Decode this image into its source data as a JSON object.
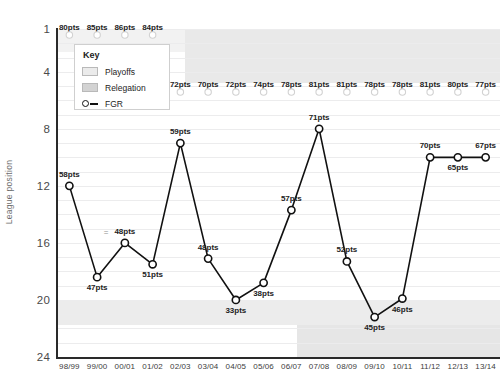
{
  "chart_data": {
    "type": "line",
    "title": "",
    "xlabel": "",
    "ylabel": "League position",
    "ylim": [
      1,
      24
    ],
    "y_inverted": true,
    "grid": true,
    "yticks": [
      1,
      4,
      8,
      12,
      16,
      20,
      24
    ],
    "categories": [
      "98/99",
      "99/00",
      "00/01",
      "01/02",
      "02/03",
      "03/04",
      "04/05",
      "05/06",
      "06/07",
      "07/08",
      "08/09",
      "09/10",
      "10/11",
      "11/12",
      "12/13",
      "13/14"
    ],
    "series": [
      {
        "name": "FGR",
        "values": [
          12,
          18.4,
          16,
          17.5,
          9,
          17.1,
          20,
          18.8,
          13.7,
          8,
          17.3,
          21.2,
          19.9,
          10,
          10,
          10
        ],
        "point_labels": [
          "58pts",
          "47pts",
          "48pts",
          "51pts",
          "59pts",
          "48pts",
          "33pts",
          "38pts",
          "57pts",
          "71pts",
          "52pts",
          "45pts",
          "46pts",
          "70pts",
          "65pts",
          "67pts"
        ],
        "label_positions": [
          "above",
          "below",
          "above",
          "below",
          "above",
          "above",
          "below",
          "below",
          "above",
          "above",
          "above",
          "below",
          "below",
          "above",
          "below",
          "above"
        ]
      },
      {
        "name": "league-champion-reference",
        "values": [
          1,
          1,
          1,
          1,
          5,
          5,
          5,
          5,
          5,
          5,
          5,
          5,
          5,
          5,
          5,
          5
        ],
        "point_labels": [
          "80pts",
          "85pts",
          "86pts",
          "84pts",
          "72pts",
          "70pts",
          "72pts",
          "74pts",
          "78pts",
          "81pts",
          "81pts",
          "78pts",
          "78pts",
          "81pts",
          "80pts",
          "77pts"
        ]
      }
    ],
    "bands": [
      {
        "name": "playoffs-upper",
        "label": "Playoffs",
        "color": "#f2f2f2",
        "y_from": 1,
        "y_to": 2.4,
        "x_from": "98/99",
        "x_to": "13/14"
      },
      {
        "name": "playoffs-upper-extended",
        "label": "Playoffs",
        "color": "#e9e9e9",
        "y_from": 1,
        "y_to": 4.4,
        "x_from": "02/03",
        "x_to": "13/14"
      },
      {
        "name": "relegation-lower",
        "label": "Relegation",
        "color": "#ececec",
        "y_from": 20.2,
        "y_to": 21.7,
        "x_from": "98/99",
        "x_to": "13/14"
      },
      {
        "name": "relegation-lower-extended",
        "label": "Relegation",
        "color": "#e6e6e6",
        "y_from": 21.7,
        "y_to": 24,
        "x_from": "06/07",
        "x_to": "13/14"
      }
    ],
    "ghost_annotation": "=",
    "colors": {
      "line": "#111111",
      "marker_fill": "#ffffff",
      "marker_stroke": "#111111",
      "grid": "#ececed",
      "axis": "#2a2a2a",
      "playoffs_band": "#ebebeb",
      "relegation_band": "#d3d3d3"
    }
  },
  "legend": {
    "title": "Key",
    "items": [
      {
        "label": "Playoffs",
        "kind": "swatch",
        "swatch": "playoffs"
      },
      {
        "label": "Relegation",
        "kind": "swatch",
        "swatch": "relegation"
      },
      {
        "label": "FGR",
        "kind": "marker"
      }
    ]
  }
}
